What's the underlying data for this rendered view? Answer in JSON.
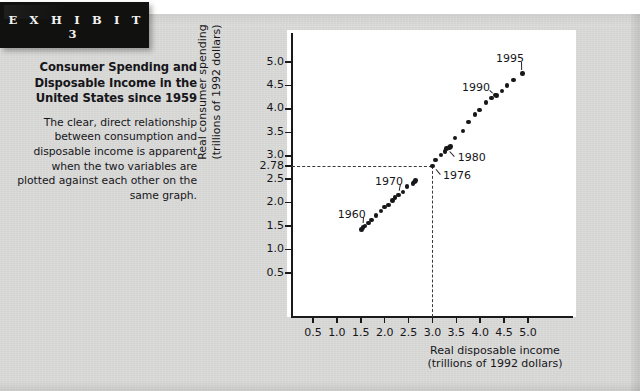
{
  "exhibit": {
    "banner_label": "E X H I B I T   3",
    "title": "Consumer Spending and Disposable Income in the United States since 1959",
    "body": "The clear, direct relationship between consumption and disposable income is apparent when the two variables are plotted against each other on the same graph."
  },
  "colors": {
    "page_background": "#d9d9d7",
    "banner_background": "#111110",
    "banner_text": "#f2f2f0",
    "plot_background": "#ffffff",
    "axis": "#1a1a1a",
    "marker": "#17171a",
    "dashed_guide": "#3a3a3a",
    "text": "#16161a"
  },
  "chart_data": {
    "type": "scatter",
    "title": "",
    "xlabel": "Real disposable income (trillions of 1992 dollars)",
    "xlabel_line1": "Real disposable income",
    "xlabel_line2": "(trillions of 1992 dollars)",
    "ylabel": "Real consumer spending (trillions of 1992 dollars)",
    "ylabel_line1": "Real consumer spending",
    "ylabel_line2": "(trillions of 1992 dollars)",
    "xlim": [
      0.0,
      5.35
    ],
    "ylim": [
      0.0,
      5.35
    ],
    "grid": false,
    "legend": "none",
    "xticks": [
      0.5,
      1.0,
      1.5,
      2.0,
      2.5,
      3.0,
      3.5,
      4.0,
      4.5,
      5.0
    ],
    "xtick_labels": [
      "0.5",
      "1.0",
      "1.5",
      "2.0",
      "2.5",
      "3.0",
      "3.5",
      "4.0",
      "4.5",
      "5.0"
    ],
    "yticks": [
      0.5,
      1.0,
      1.5,
      2.0,
      2.5,
      2.78,
      3.0,
      3.5,
      4.0,
      4.5,
      5.0
    ],
    "ytick_labels": [
      "0.5",
      "1.0",
      "1.5",
      "2.0",
      "2.5",
      "2.78",
      "3.0",
      "3.5",
      "4.0",
      "4.5",
      "5.0"
    ],
    "series": [
      {
        "name": "Consumer spending vs disposable income, 1959-1995",
        "points": [
          {
            "year": 1959,
            "x": 1.51,
            "y": 1.43
          },
          {
            "year": 1960,
            "x": 1.55,
            "y": 1.47
          },
          {
            "year": 1961,
            "x": 1.59,
            "y": 1.5
          },
          {
            "year": 1962,
            "x": 1.66,
            "y": 1.57
          },
          {
            "year": 1963,
            "x": 1.72,
            "y": 1.63
          },
          {
            "year": 1964,
            "x": 1.82,
            "y": 1.72
          },
          {
            "year": 1965,
            "x": 1.92,
            "y": 1.82
          },
          {
            "year": 1966,
            "x": 2.0,
            "y": 1.91
          },
          {
            "year": 1967,
            "x": 2.08,
            "y": 1.95
          },
          {
            "year": 1968,
            "x": 2.16,
            "y": 2.05
          },
          {
            "year": 1969,
            "x": 2.22,
            "y": 2.11
          },
          {
            "year": 1970,
            "x": 2.29,
            "y": 2.16
          },
          {
            "year": 1971,
            "x": 2.38,
            "y": 2.23
          },
          {
            "year": 1972,
            "x": 2.47,
            "y": 2.35
          },
          {
            "year": 1973,
            "x": 2.62,
            "y": 2.44
          },
          {
            "year": 1974,
            "x": 2.59,
            "y": 2.41
          },
          {
            "year": 1975,
            "x": 2.65,
            "y": 2.47
          },
          {
            "year": 1976,
            "x": 3.0,
            "y": 2.78
          },
          {
            "year": 1977,
            "x": 3.06,
            "y": 2.91
          },
          {
            "year": 1978,
            "x": 3.18,
            "y": 3.02
          },
          {
            "year": 1979,
            "x": 3.26,
            "y": 3.09
          },
          {
            "year": 1980,
            "x": 3.3,
            "y": 3.15
          },
          {
            "year": 1981,
            "x": 3.36,
            "y": 3.18
          },
          {
            "year": 1982,
            "x": 3.38,
            "y": 3.2
          },
          {
            "year": 1983,
            "x": 3.47,
            "y": 3.38
          },
          {
            "year": 1984,
            "x": 3.64,
            "y": 3.53
          },
          {
            "year": 1985,
            "x": 3.76,
            "y": 3.72
          },
          {
            "year": 1986,
            "x": 3.89,
            "y": 3.88
          },
          {
            "year": 1987,
            "x": 3.98,
            "y": 3.98
          },
          {
            "year": 1988,
            "x": 4.12,
            "y": 4.13
          },
          {
            "year": 1989,
            "x": 4.23,
            "y": 4.23
          },
          {
            "year": 1990,
            "x": 4.31,
            "y": 4.3
          },
          {
            "year": 1991,
            "x": 4.34,
            "y": 4.28
          },
          {
            "year": 1992,
            "x": 4.46,
            "y": 4.38
          },
          {
            "year": 1993,
            "x": 4.56,
            "y": 4.5
          },
          {
            "year": 1994,
            "x": 4.7,
            "y": 4.62
          },
          {
            "year": 1995,
            "x": 4.88,
            "y": 4.75
          }
        ]
      }
    ],
    "annotations": [
      {
        "label": "1960",
        "x": 1.55,
        "y": 1.47,
        "text_x": 1.02,
        "text_y": 1.73
      },
      {
        "label": "1970",
        "x": 2.29,
        "y": 2.16,
        "text_x": 1.8,
        "text_y": 2.44
      },
      {
        "label": "1976",
        "x": 3.0,
        "y": 2.78,
        "text_x": 3.22,
        "text_y": 2.56
      },
      {
        "label": "1980",
        "x": 3.3,
        "y": 3.15,
        "text_x": 3.53,
        "text_y": 2.94
      },
      {
        "label": "1990",
        "x": 4.31,
        "y": 4.3,
        "text_x": 3.62,
        "text_y": 4.44
      },
      {
        "label": "1995",
        "x": 4.88,
        "y": 4.75,
        "text_x": 4.33,
        "text_y": 5.05
      }
    ],
    "reference_lines": [
      {
        "orientation": "horizontal",
        "value": 2.78,
        "style": "dashed",
        "from": 0.0,
        "to": 3.0
      },
      {
        "orientation": "vertical",
        "value": 3.0,
        "style": "dashed",
        "from": 0.0,
        "to": 2.78
      }
    ]
  }
}
